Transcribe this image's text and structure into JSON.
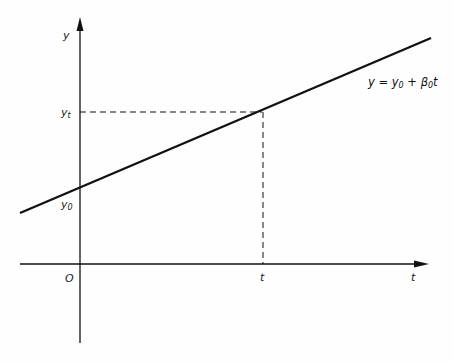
{
  "figure": {
    "type": "linear-growth-diagram",
    "axes": {
      "y_label": "y",
      "x_label": "t",
      "origin_label": "O"
    },
    "line": {
      "equation_parts": {
        "lhs": "y",
        "eq": " = ",
        "y0_main": "y",
        "y0_sub": "0",
        "plus": " + ",
        "beta_main": "β",
        "beta_sub": "0",
        "var": "t"
      },
      "equation_text": "y = y0 + β0t"
    },
    "markers": {
      "y0_main": "y",
      "y0_sub": "0",
      "yt_main": "y",
      "yt_sub": "t",
      "t_tick": "t"
    },
    "colors": {
      "ink": "#111111",
      "background": "#fefefe"
    }
  }
}
